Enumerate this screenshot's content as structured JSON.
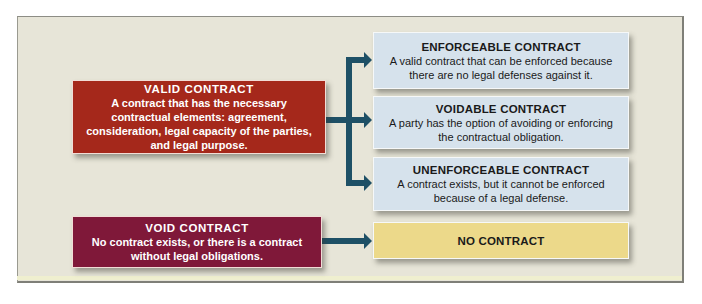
{
  "colors": {
    "panel_bg": "#e7e5d8",
    "valid_bg": "#a5281b",
    "void_bg": "#7f1839",
    "outcome_bg": "#d6e2ec",
    "no_contract_bg": "#ecd98a",
    "arrow": "#1e5066"
  },
  "left": {
    "valid": {
      "title": "VALID CONTRACT",
      "desc": "A contract that has the necessary contractual elements: agreement, consideration, legal capacity of the parties, and legal purpose."
    },
    "void": {
      "title": "VOID CONTRACT",
      "desc": "No contract exists, or there is a contract without legal obligations."
    }
  },
  "right": {
    "enforceable": {
      "title": "ENFORCEABLE CONTRACT",
      "desc": "A valid contract that can be enforced because there are no legal defenses against it."
    },
    "voidable": {
      "title": "VOIDABLE CONTRACT",
      "desc": "A party has the option of avoiding or enforcing the contractual obligation."
    },
    "unenforceable": {
      "title": "UNENFORCEABLE CONTRACT",
      "desc": "A contract exists, but it cannot be enforced because of a legal defense."
    },
    "no_contract": {
      "title": "NO CONTRACT"
    }
  }
}
